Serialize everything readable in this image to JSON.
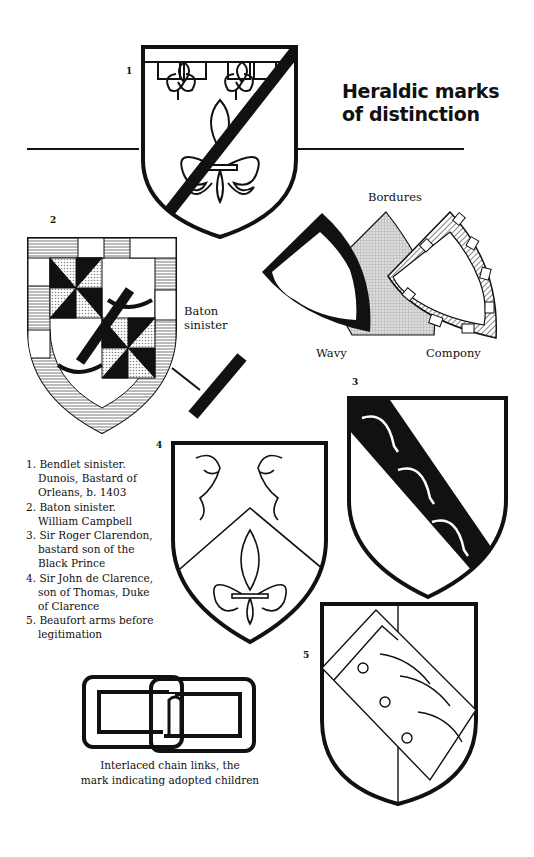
{
  "page": {
    "title_line1": "Heraldic marks",
    "title_line2": "of distinction"
  },
  "figures": [
    {
      "number": "1",
      "name": "Bendlet sinister"
    },
    {
      "number": "2",
      "name": "Baton sinister"
    },
    {
      "number": "3",
      "name": "Sir Roger Clarendon"
    },
    {
      "number": "4",
      "name": "Sir John de Clarence"
    },
    {
      "number": "5",
      "name": "Beaufort arms"
    }
  ],
  "labels": {
    "baton_line1": "Baton",
    "baton_line2": "sinister",
    "bordures": "Bordures",
    "wavy": "Wavy",
    "compony": "Compony"
  },
  "legend": [
    {
      "marker": "1.",
      "text": "Bendlet sinister. Dunois, Bastard of Orleans, b. 1403"
    },
    {
      "marker": "2.",
      "text": "Baton sinister. William Campbell"
    },
    {
      "marker": "3.",
      "text": "Sir Roger Clarendon, bastard son of the Black Prince"
    },
    {
      "marker": "4.",
      "text": "Sir John de Clarence, son of Thomas, Duke of Clarence"
    },
    {
      "marker": "5.",
      "text": "Beaufort arms before legitimation"
    }
  ],
  "chain_caption": {
    "line1": "Interlaced chain links, the",
    "line2": "mark indicating adopted children"
  },
  "colors": {
    "ink": "#111111",
    "paper": "#ffffff",
    "hatch": "#9a9a9a"
  }
}
